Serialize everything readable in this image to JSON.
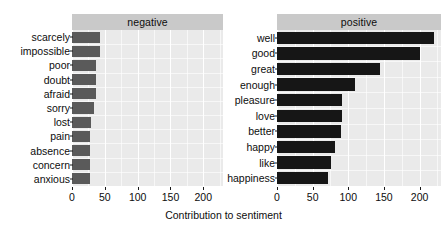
{
  "chart_data": {
    "type": "bar",
    "title": "",
    "subtitle": "",
    "xlabel": "Contribution to sentiment",
    "ylabel": "",
    "orientation": "horizontal",
    "xlim": [
      0,
      230
    ],
    "xticks": [
      0,
      50,
      100,
      150,
      200
    ],
    "xticklabels": [
      "0",
      "50",
      "100",
      "150",
      "200"
    ],
    "grid": true,
    "legend": false,
    "facets": [
      {
        "label": "negative",
        "bar_color": "#5a5a5a",
        "categories": [
          "scarcely",
          "impossible",
          "poor",
          "doubt",
          "afraid",
          "sorry",
          "lost",
          "pain",
          "absence",
          "concern",
          "anxious"
        ],
        "values": [
          43,
          42,
          37,
          37,
          36,
          33,
          29,
          28,
          28,
          28,
          27
        ]
      },
      {
        "label": "positive",
        "bar_color": "#161616",
        "categories": [
          "well",
          "good",
          "great",
          "enough",
          "pleasure",
          "love",
          "better",
          "happy",
          "like",
          "happiness"
        ],
        "values": [
          220,
          201,
          144,
          110,
          91,
          91,
          90,
          82,
          76,
          71
        ]
      }
    ]
  },
  "panel_strip_color": "#c9c9c9",
  "plot_background_color": "#eaeaea",
  "gridline_color": "#ffffff"
}
